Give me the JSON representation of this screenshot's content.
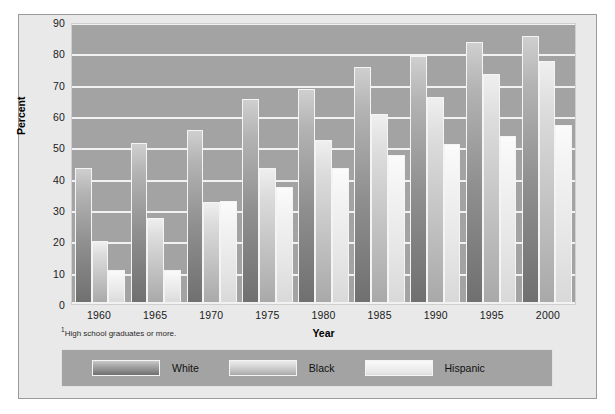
{
  "chart_data": {
    "type": "bar",
    "title": "",
    "xlabel": "Year",
    "ylabel": "Percent",
    "ylim": [
      0,
      90
    ],
    "yticks": [
      90,
      80,
      70,
      60,
      50,
      40,
      30,
      20,
      10,
      0
    ],
    "grid": true,
    "legend_position": "bottom",
    "categories": [
      "1960",
      "1965",
      "1970",
      "1975",
      "1980",
      "1985",
      "1990",
      "1995",
      "2000"
    ],
    "series": [
      {
        "name": "White",
        "values": [
          43.5,
          51.5,
          55.5,
          65.5,
          68.5,
          75.5,
          79.0,
          83.5,
          85.5
        ]
      },
      {
        "name": "Black",
        "values": [
          20.0,
          27.5,
          32.5,
          43.5,
          52.5,
          60.5,
          66.0,
          73.5,
          77.5
        ]
      },
      {
        "name": "Hispanic",
        "values": [
          11.0,
          11.0,
          33.0,
          37.5,
          43.5,
          47.5,
          51.0,
          53.5,
          57.0
        ]
      }
    ],
    "footnote": "High school graduates or more.",
    "footnote_marker": "1",
    "colors": {
      "plot_background": "#a3a3a3",
      "gridline": "#f2f2f2",
      "panel_background": "#e9e9e9",
      "series_white": "#8f8f8f",
      "series_black": "#c2c2c2",
      "series_hispanic": "#e6e6e6"
    }
  },
  "legend": {
    "items": [
      {
        "label": "White"
      },
      {
        "label": "Black"
      },
      {
        "label": "Hispanic"
      }
    ]
  }
}
